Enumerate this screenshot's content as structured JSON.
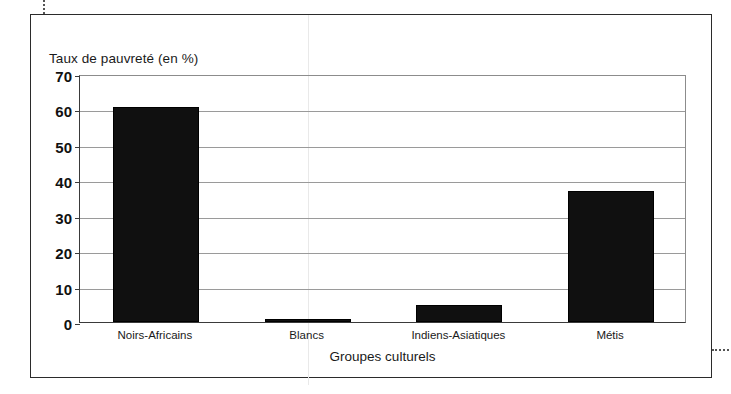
{
  "figure": {
    "marks": {
      "top_registration": "dotted-crop-mark",
      "right_registration": "dotted-crop-mark"
    }
  },
  "chart_data": {
    "type": "bar",
    "title": "",
    "subtitle": "",
    "xlabel": "Groupes culturels",
    "ylabel": "Taux de pauvreté (en %)",
    "categories": [
      "Noirs-Africains",
      "Blancs",
      "Indiens-Asiatiques",
      "Métis"
    ],
    "values": [
      60.7,
      0.8,
      4.8,
      37.0
    ],
    "ylim": [
      0,
      70
    ],
    "yticks": [
      0,
      10,
      20,
      30,
      40,
      50,
      60,
      70
    ],
    "ytick_labels": [
      "0",
      "10",
      "20",
      "30",
      "40",
      "50",
      "60",
      "70"
    ],
    "grid": true,
    "legend": "none",
    "bar_color": "#101010",
    "gridline_color": "#9a9a9a",
    "axis_color": "#3a3a3a"
  }
}
